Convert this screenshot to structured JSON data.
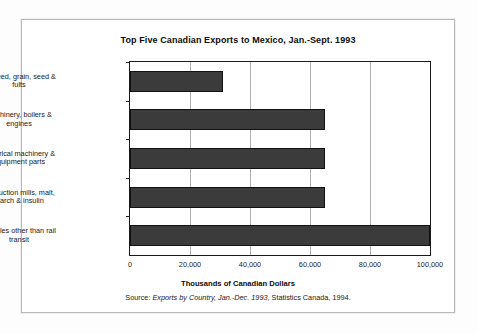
{
  "figure": {
    "title": "Top Five Canadian Exports to Mexico, Jan.-Sept. 1993",
    "xaxis_title": "Thousands of Canadian Dollars",
    "source_prefix": "Source:",
    "source_italic": "Exports by Country, Jan.-Dec. 1993",
    "source_suffix": ", Statistics Canada, 1994."
  },
  "chart_data": {
    "type": "bar",
    "orientation": "horizontal",
    "title": "Top Five Canadian Exports to Mexico, Jan.-Sept. 1993",
    "xlabel": "Thousands of Canadian Dollars",
    "ylabel": "",
    "categories": [
      "Oil seed, grain, seed & fults",
      "Machinery, boilers & engines",
      "Electrical machinery & equipment parts",
      "Production mills, malt, starch & insulin",
      "Vehicles other than rail transit"
    ],
    "category_lines": [
      [
        "Oil seed, grain, seed &",
        "fults"
      ],
      [
        "Machinery, boilers &",
        "engines"
      ],
      [
        "Electrical machinery &",
        "equipment parts"
      ],
      [
        "Production mills, malt,",
        "starch & insulin"
      ],
      [
        "Vehicles other than rail",
        "transit"
      ]
    ],
    "values": [
      31000,
      65000,
      65000,
      65000,
      100000
    ],
    "xlim": [
      0,
      100000
    ],
    "xticks": [
      0,
      20000,
      40000,
      60000,
      80000,
      100000
    ],
    "xtick_labels": [
      "0",
      "20,000",
      "40,000",
      "60,000",
      "80,000",
      "100,000"
    ],
    "grid": "vertical",
    "legend": "none",
    "bar_color": "#3b3b3b",
    "bar_edge_color": "#111111"
  }
}
